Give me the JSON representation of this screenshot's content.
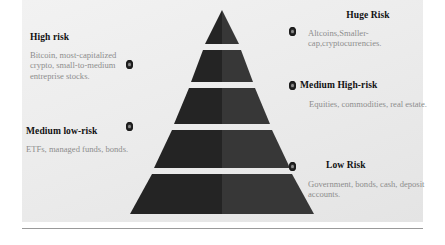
{
  "diagram": {
    "title_type": "risk-pyramid",
    "shape": "pyramid",
    "levels": 5,
    "colors": {
      "panel_background": "#ececec",
      "page_background": "#ffffff",
      "pyramid_left_face": "#242424",
      "pyramid_right_face": "#3a3a3a",
      "heading_text": "#111111",
      "body_text": "#8d8d8d",
      "marker": "#2e2e2e",
      "baseline_rule": "#9a9a9a"
    }
  },
  "left_labels": [
    {
      "id": "high-risk",
      "heading": "High risk",
      "body": "Bitcoin, most-capitalized crypto, small-to-medium entreprise stocks.",
      "marker": "level-marker-dot"
    },
    {
      "id": "medium-low-risk",
      "heading": "Medium low-risk",
      "body": "ETFs, managed funds, bonds.",
      "marker": "level-marker-dot"
    }
  ],
  "right_labels": [
    {
      "id": "huge-risk",
      "heading": "Huge Risk",
      "body": "Altcoins,Smaller-cap,cryptocurrencies.",
      "marker": "level-marker-dot"
    },
    {
      "id": "medium-high-risk",
      "heading": "Medium High-risk",
      "body": "Equities, commodities, real estate.",
      "marker": "level-marker-dot"
    },
    {
      "id": "low-risk",
      "heading": "Low Risk",
      "body": "Government, bonds, cash, deposit accounts.",
      "marker": "level-marker-dot"
    }
  ]
}
